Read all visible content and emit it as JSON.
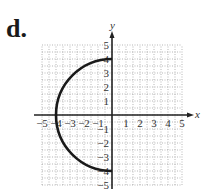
{
  "problem_label": "d.",
  "chart_data": {
    "type": "line",
    "title": "",
    "xlabel": "x",
    "ylabel": "y",
    "xlim": [
      -5,
      5
    ],
    "ylim": [
      -5,
      5
    ],
    "grid": true,
    "x_ticks": [
      "-5",
      "-4",
      "-3",
      "-2",
      "-1",
      "1",
      "2",
      "3",
      "4",
      "5"
    ],
    "y_ticks": [
      "5",
      "4",
      "3",
      "2",
      "1",
      "-1",
      "-2",
      "-3",
      "-4",
      "-5"
    ],
    "series": [
      {
        "name": "left semicircle x = -sqrt(16 - y^2)",
        "description": "Left half of circle of radius 4 centered at origin",
        "points": [
          [
            0,
            4
          ],
          [
            -2,
            3.46
          ],
          [
            -3.46,
            2
          ],
          [
            -4,
            0
          ],
          [
            -3.46,
            -2
          ],
          [
            -2,
            -3.46
          ],
          [
            0,
            -4
          ]
        ]
      }
    ],
    "colors": {
      "curve": "#1a1a1a",
      "axes": "#222222",
      "grid": "#9a9a9a"
    }
  }
}
